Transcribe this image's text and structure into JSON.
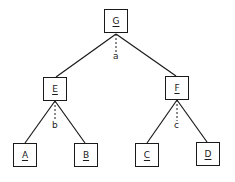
{
  "diagram": {
    "type": "tree",
    "nodes": [
      {
        "id": "G",
        "label": "G",
        "x": 104,
        "y": 9
      },
      {
        "id": "E",
        "label": "E",
        "x": 43,
        "y": 77
      },
      {
        "id": "F",
        "label": "F",
        "x": 165,
        "y": 76
      },
      {
        "id": "A",
        "label": "A",
        "x": 13,
        "y": 143
      },
      {
        "id": "B",
        "label": "B",
        "x": 74,
        "y": 143
      },
      {
        "id": "C",
        "label": "C",
        "x": 135,
        "y": 143
      },
      {
        "id": "D",
        "label": "D",
        "x": 196,
        "y": 142
      }
    ],
    "edges": [
      {
        "from": "G",
        "to": "E"
      },
      {
        "from": "G",
        "to": "F"
      },
      {
        "from": "E",
        "to": "A"
      },
      {
        "from": "E",
        "to": "B"
      },
      {
        "from": "F",
        "to": "C"
      },
      {
        "from": "F",
        "to": "D"
      }
    ],
    "dashed_labels": [
      {
        "node": "G",
        "label": "a"
      },
      {
        "node": "E",
        "label": "b"
      },
      {
        "node": "F",
        "label": "c"
      }
    ]
  }
}
